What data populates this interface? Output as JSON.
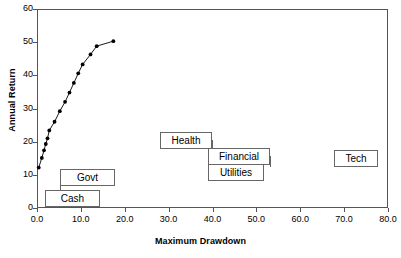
{
  "chart_data": {
    "type": "scatter",
    "title": "",
    "xlabel": "Maximum Drawdown",
    "ylabel": "Annual Return",
    "xlim": [
      0,
      80
    ],
    "ylim": [
      0,
      60
    ],
    "xticks": [
      "0.0",
      "10.0",
      "20.0",
      "30.0",
      "40.0",
      "50.0",
      "60.0",
      "70.0",
      "80.0"
    ],
    "yticks": [
      "0",
      "10",
      "20",
      "30",
      "40",
      "50",
      "60"
    ],
    "grid": false,
    "legend": "none",
    "marker": "filled-circle-with-line",
    "series": [
      {
        "name": "efficient-frontier",
        "points": [
          {
            "x": 0.4,
            "y": 12.2
          },
          {
            "x": 1.1,
            "y": 15.1
          },
          {
            "x": 1.6,
            "y": 17.4
          },
          {
            "x": 2.0,
            "y": 19.3
          },
          {
            "x": 2.4,
            "y": 21.0
          },
          {
            "x": 2.8,
            "y": 23.4
          },
          {
            "x": 4.0,
            "y": 26.0
          },
          {
            "x": 5.2,
            "y": 29.2
          },
          {
            "x": 6.4,
            "y": 32.0
          },
          {
            "x": 7.4,
            "y": 34.8
          },
          {
            "x": 8.4,
            "y": 37.7
          },
          {
            "x": 9.4,
            "y": 40.6
          },
          {
            "x": 10.4,
            "y": 43.3
          },
          {
            "x": 12.2,
            "y": 46.3
          },
          {
            "x": 13.6,
            "y": 48.8
          },
          {
            "x": 17.4,
            "y": 50.3
          }
        ]
      }
    ],
    "annotations": [
      {
        "label": "Cash",
        "anchor_x": 0.5,
        "anchor_y": 5.0
      },
      {
        "label": "Govt",
        "anchor_x": 2.0,
        "anchor_y": 9.5
      },
      {
        "label": "Health",
        "anchor_x": 40.0,
        "anchor_y": 28.0
      },
      {
        "label": "Financial",
        "anchor_x": 50.0,
        "anchor_y": 24.0
      },
      {
        "label": "Utilities",
        "anchor_x": 50.0,
        "anchor_y": 20.0
      },
      {
        "label": "Tech",
        "anchor_x": 70.0,
        "anchor_y": 22.0
      }
    ]
  },
  "colors": {
    "axis": "#555555",
    "series": "#000000",
    "callout_border": "#666666",
    "background": "#ffffff"
  }
}
